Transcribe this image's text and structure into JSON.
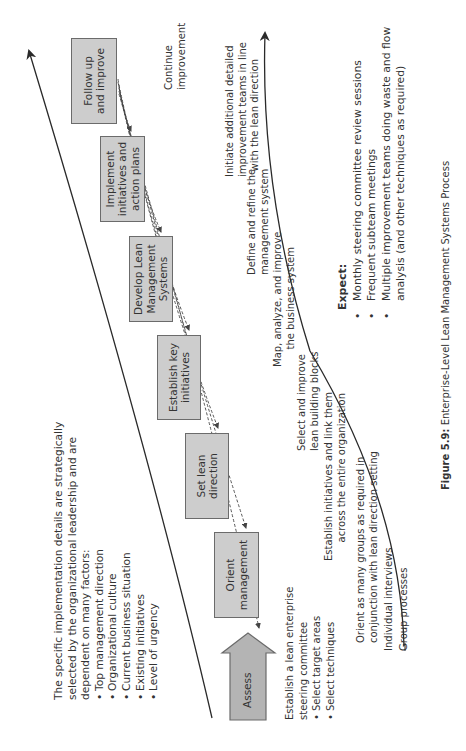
{
  "caption": {
    "figure_label": "Figure 5.9:",
    "title": "Enterprise-Level Lean Management Systems Process"
  },
  "steps": [
    {
      "id": "assess",
      "label": "Assess",
      "shape": "block-arrow"
    },
    {
      "id": "orient",
      "label_lines": [
        "Orient",
        "management"
      ]
    },
    {
      "id": "set-lean-direction",
      "label_lines": [
        "Set lean",
        "direction"
      ]
    },
    {
      "id": "establish-key-initiatives",
      "label_lines": [
        "Establish key",
        "initiatives"
      ]
    },
    {
      "id": "develop-lean-management-systems",
      "label_lines": [
        "Develop Lean",
        "Management",
        "Systems"
      ]
    },
    {
      "id": "implement-initiatives",
      "label_lines": [
        "Implement",
        "initiatives and",
        "action plans"
      ]
    },
    {
      "id": "follow-up-and-improve",
      "label_lines": [
        "Follow up",
        "and improve"
      ]
    }
  ],
  "factors": {
    "intro_lines": [
      "The specific implementation details are strategically",
      "selected by the organizational leadership and are",
      "dependent on many factors:"
    ],
    "bullets": [
      "Top management direction",
      "Organizational culture",
      "Current business situation",
      "Existing initiatives",
      "Level of urgency"
    ]
  },
  "assess_notes": {
    "lines": [
      "Establish a lean enterprise",
      "steering committee"
    ],
    "bullets": [
      "Select target areas",
      "Select techniques"
    ]
  },
  "activities": {
    "continue": [
      "Continue",
      "improvement"
    ],
    "initiate": [
      "Initiate additional detailed",
      "improvement teams in line",
      "with the lean direction"
    ],
    "define": [
      "Define and refine the",
      "management system"
    ],
    "map": [
      "Map, analyze, and improve",
      "the business system"
    ],
    "select": [
      "Select and improve",
      "lean building blocks"
    ],
    "establish": [
      "Establish initiatives and link them",
      "across the entire organization"
    ],
    "orient_groups": [
      "Orient as many groups as required in",
      "conjunction with lean direction setting"
    ],
    "individual": "Individual interviews",
    "group": "Group processes"
  },
  "expect": {
    "title": "Expect:",
    "bullets": [
      [
        "Monthly steering committee review sessions"
      ],
      [
        "Frequent subteam meetings"
      ],
      [
        "Multiple improvement teams doing waste and flow",
        "analysis (and other techniques as required)"
      ]
    ]
  },
  "colors": {
    "box_fill": "#cdcdcd",
    "box_border": "#6b6b6b",
    "assess_fill": "#b4b4b4",
    "line": "#2a2a2a",
    "text": "#333333"
  }
}
